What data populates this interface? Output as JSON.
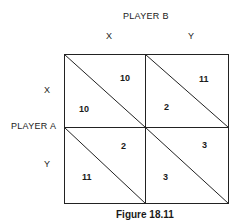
{
  "diagram": {
    "column_player": "PLAYER B",
    "row_player": "PLAYER A",
    "column_strategies": [
      "X",
      "Y"
    ],
    "row_strategies": [
      "X",
      "Y"
    ],
    "cells": [
      {
        "row": "X",
        "col": "X",
        "payoff_b": "10",
        "payoff_a": "10"
      },
      {
        "row": "X",
        "col": "Y",
        "payoff_b": "11",
        "payoff_a": "2"
      },
      {
        "row": "Y",
        "col": "X",
        "payoff_b": "2",
        "payoff_a": "11"
      },
      {
        "row": "Y",
        "col": "Y",
        "payoff_b": "3",
        "payoff_a": "3"
      }
    ],
    "caption": "Figure 18.11"
  }
}
